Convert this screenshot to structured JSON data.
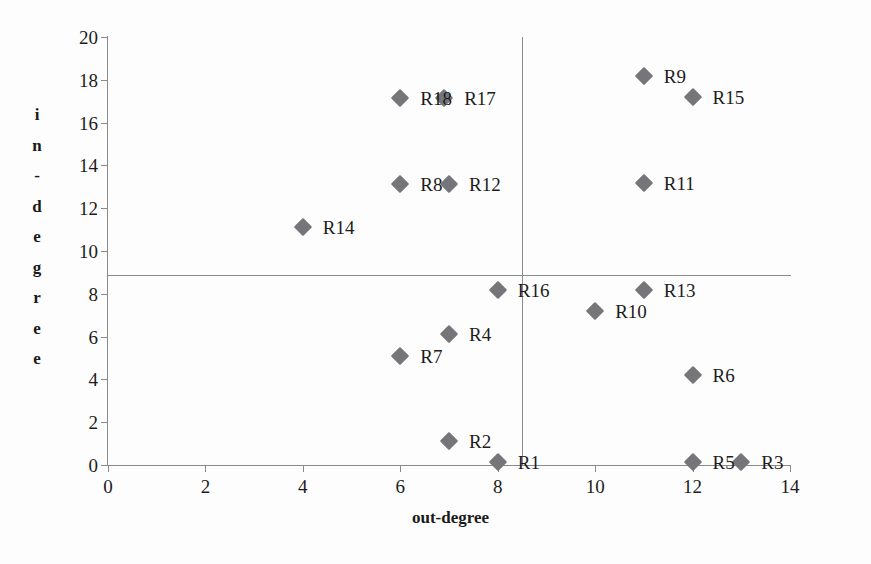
{
  "chart_data": {
    "type": "scatter",
    "title": "",
    "xlabel": "out-degree",
    "ylabel": "in-degree",
    "xlim": [
      0,
      14
    ],
    "ylim": [
      0,
      20
    ],
    "xticks": [
      0,
      2,
      4,
      6,
      8,
      10,
      12,
      14
    ],
    "yticks": [
      0,
      2,
      4,
      6,
      8,
      10,
      12,
      14,
      16,
      18,
      20
    ],
    "grid": false,
    "legend": "none",
    "marker_color": "#76767a",
    "marker_shape": "diamond",
    "reference_lines": [
      {
        "orientation": "horizontal",
        "value": 8.9,
        "axis": "y"
      },
      {
        "orientation": "vertical",
        "value": 8.5,
        "axis": "x"
      }
    ],
    "points": [
      {
        "label": "R1",
        "x": 8,
        "y": 0.15,
        "label_dx": 20,
        "label_dy": 0
      },
      {
        "label": "R2",
        "x": 7,
        "y": 1.1,
        "label_dx": 20,
        "label_dy": 0
      },
      {
        "label": "R3",
        "x": 13,
        "y": 0.15,
        "label_dx": 20,
        "label_dy": 0
      },
      {
        "label": "R4",
        "x": 7,
        "y": 6.1,
        "label_dx": 20,
        "label_dy": 0
      },
      {
        "label": "R5",
        "x": 12,
        "y": 0.15,
        "label_dx": 20,
        "label_dy": 0
      },
      {
        "label": "R6",
        "x": 12,
        "y": 4.2,
        "label_dx": 20,
        "label_dy": 0
      },
      {
        "label": "R7",
        "x": 6,
        "y": 5.1,
        "label_dx": 20,
        "label_dy": 0
      },
      {
        "label": "R8",
        "x": 6,
        "y": 13.15,
        "label_dx": 20,
        "label_dy": 0
      },
      {
        "label": "R9",
        "x": 11,
        "y": 18.2,
        "label_dx": 20,
        "label_dy": 0
      },
      {
        "label": "R10",
        "x": 10,
        "y": 7.2,
        "label_dx": 20,
        "label_dy": 0
      },
      {
        "label": "R11",
        "x": 11,
        "y": 13.2,
        "label_dx": 20,
        "label_dy": 0
      },
      {
        "label": "R12",
        "x": 7,
        "y": 13.15,
        "label_dx": 20,
        "label_dy": 0
      },
      {
        "label": "R13",
        "x": 11,
        "y": 8.2,
        "label_dx": 20,
        "label_dy": 0
      },
      {
        "label": "R14",
        "x": 4,
        "y": 11.1,
        "label_dx": 20,
        "label_dy": 0
      },
      {
        "label": "R15",
        "x": 12,
        "y": 17.2,
        "label_dx": 20,
        "label_dy": 0
      },
      {
        "label": "R16",
        "x": 8,
        "y": 8.2,
        "label_dx": 20,
        "label_dy": 0
      },
      {
        "label": "R17",
        "x": 6.9,
        "y": 17.15,
        "label_dx": 20,
        "label_dy": 0
      },
      {
        "label": "R18",
        "x": 6,
        "y": 17.15,
        "label_dx": 20,
        "label_dy": 0
      }
    ]
  },
  "axis": {
    "y_title_chars": [
      "i",
      "n",
      "-",
      "d",
      "e",
      "g",
      "r",
      "e",
      "e"
    ],
    "x_title": "out-degree"
  }
}
